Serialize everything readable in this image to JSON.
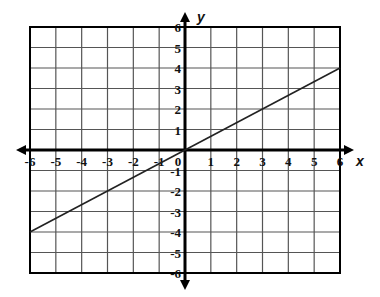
{
  "chart_data": {
    "type": "line",
    "title": "",
    "xlabel": "x",
    "ylabel": "y",
    "xlim": [
      -6,
      6
    ],
    "ylim": [
      -6,
      6
    ],
    "grid": true,
    "x_ticks": [
      "-6",
      "-5",
      "-4",
      "-3",
      "-2",
      "-1",
      "0",
      "1",
      "2",
      "3",
      "4",
      "5",
      "6"
    ],
    "y_ticks": [
      "-6",
      "-5",
      "-4",
      "-3",
      "-2",
      "-1",
      "1",
      "2",
      "3",
      "4",
      "5",
      "6"
    ],
    "series": [
      {
        "name": "line",
        "equation": "y = (2/3)x",
        "x": [
          -6,
          6
        ],
        "y": [
          -4,
          4
        ]
      }
    ]
  },
  "colors": {
    "grid": "#555555",
    "axis": "#000000",
    "line": "#222222",
    "background": "#ffffff"
  }
}
